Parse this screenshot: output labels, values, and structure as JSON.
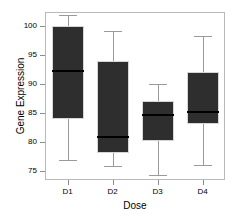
{
  "chart_data": {
    "type": "box",
    "title": "",
    "xlabel": "Dose",
    "ylabel": "Gene Expression",
    "categories": [
      "D1",
      "D2",
      "D3",
      "D4"
    ],
    "ylim": [
      73.5,
      102.5
    ],
    "yticks": [
      75,
      80,
      85,
      90,
      95,
      100
    ],
    "ytick_labels": [
      "75",
      "80",
      "85",
      "90",
      "95",
      "100"
    ],
    "grid": false,
    "legend": null,
    "box_fill_color": "#2e2e2e",
    "median_color": "#000000",
    "whisker_color": "#9a9a9a",
    "frame_color": "#b9b9b9",
    "boxes": [
      {
        "category": "D1",
        "whisker_low": 77.0,
        "q1": 84.0,
        "median": 92.4,
        "q3": 100.1,
        "whisker_high": 102.0
      },
      {
        "category": "D2",
        "whisker_low": 76.0,
        "q1": 78.2,
        "median": 81.0,
        "q3": 94.1,
        "whisker_high": 99.2
      },
      {
        "category": "D3",
        "whisker_low": 74.3,
        "q1": 80.2,
        "median": 84.7,
        "q3": 87.2,
        "whisker_high": 90.1
      },
      {
        "category": "D4",
        "whisker_low": 76.1,
        "q1": 83.2,
        "median": 85.3,
        "q3": 92.2,
        "whisker_high": 98.3
      }
    ]
  }
}
